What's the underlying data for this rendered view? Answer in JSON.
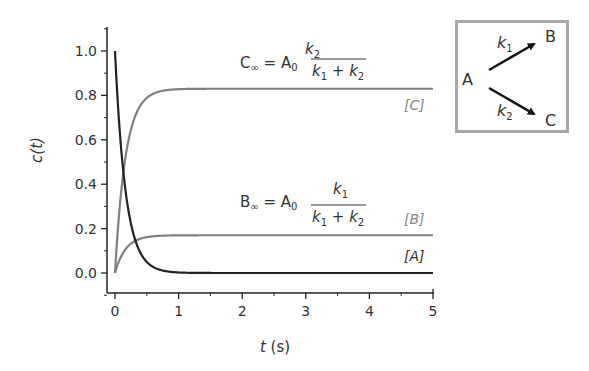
{
  "chart_data": {
    "type": "line",
    "title": "",
    "xlabel": "t (s)",
    "ylabel": "c(t)",
    "xlim": [
      0,
      5
    ],
    "ylim": [
      -0.1,
      1.1
    ],
    "x_ticks": [
      "0",
      "1",
      "2",
      "3",
      "4",
      "5"
    ],
    "y_ticks": [
      "0.0",
      "0.2",
      "0.4",
      "0.6",
      "0.8",
      "1.0"
    ],
    "grid": false,
    "series": [
      {
        "name": "[A]",
        "color": "#222222",
        "formula": "A0*exp(-(k1+k2)t)",
        "x": [
          0,
          0.1,
          0.2,
          0.3,
          0.5,
          0.75,
          1,
          2,
          3,
          4,
          5
        ],
        "values": [
          1.0,
          0.55,
          0.3,
          0.165,
          0.05,
          0.011,
          0.0025,
          0.0,
          0.0,
          0.0,
          0.0
        ]
      },
      {
        "name": "[B]",
        "color": "#808080",
        "formula": "B_inf*(1-exp(-(k1+k2)t))",
        "x": [
          0,
          0.1,
          0.2,
          0.3,
          0.5,
          0.75,
          1,
          2,
          3,
          4,
          5
        ],
        "values": [
          0.0,
          0.077,
          0.119,
          0.142,
          0.162,
          0.168,
          0.17,
          0.17,
          0.17,
          0.17,
          0.17
        ]
      },
      {
        "name": "[C]",
        "color": "#808080",
        "formula": "C_inf*(1-exp(-(k1+k2)t))",
        "x": [
          0,
          0.1,
          0.2,
          0.3,
          0.5,
          0.75,
          1,
          2,
          3,
          4,
          5
        ],
        "values": [
          0.0,
          0.373,
          0.581,
          0.693,
          0.79,
          0.82,
          0.828,
          0.83,
          0.83,
          0.83,
          0.83
        ]
      }
    ],
    "annotations": [
      {
        "text": "C∞ = A0 k2/(k1 + k2)",
        "near": "[C] plateau"
      },
      {
        "text": "B∞ = A0 k1/(k1 + k2)",
        "near": "[B] plateau"
      }
    ],
    "inset": {
      "text": "A → B (k1), A → C (k2)"
    }
  },
  "axes": {
    "ylabel_main": "c(",
    "ylabel_var": "t",
    "ylabel_close": ")",
    "xlabel_var": "t",
    "xlabel_unit": " (s)",
    "x_ticks": [
      "0",
      "1",
      "2",
      "3",
      "4",
      "5"
    ],
    "y_ticks": [
      "0.0",
      "0.2",
      "0.4",
      "0.6",
      "0.8",
      "1.0"
    ]
  },
  "labels": {
    "A": "[A]",
    "B": "[B]",
    "C": "[C]"
  },
  "equations": {
    "c_inf": {
      "lhs": "C",
      "lhs_sub": "∞",
      "eq": " = A",
      "a_sub": "0",
      "num": "k",
      "num_sub": "2",
      "den_k1": "k",
      "den_k1_sub": "1",
      "den_plus": " + ",
      "den_k2": "k",
      "den_k2_sub": "2"
    },
    "b_inf": {
      "lhs": "B",
      "lhs_sub": "∞",
      "eq": " = A",
      "a_sub": "0",
      "num": "k",
      "num_sub": "1",
      "den_k1": "k",
      "den_k1_sub": "1",
      "den_plus": " + ",
      "den_k2": "k",
      "den_k2_sub": "2"
    }
  },
  "inset": {
    "A": "A",
    "B": "B",
    "C": "C",
    "k1": "k",
    "k1_sub": "1",
    "k2": "k",
    "k2_sub": "2"
  },
  "colors": {
    "A_curve": "#222222",
    "BC_curve": "#808080",
    "inset_border": "#a8a8a8"
  }
}
